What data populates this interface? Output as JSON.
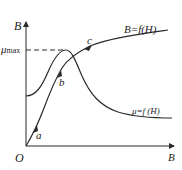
{
  "axes": {
    "y_label": "B",
    "x_label": "B",
    "origin_label": "O",
    "mu_max_label": "μ",
    "mu_max_sub": "max"
  },
  "curves": {
    "b_curve_label": "B=f(H)",
    "mu_curve_label": "μ=f (H)"
  },
  "points": {
    "a": "a",
    "b": "b",
    "c": "c"
  },
  "colors": {
    "line": "#2a2a2a",
    "background": "#ffffff"
  }
}
